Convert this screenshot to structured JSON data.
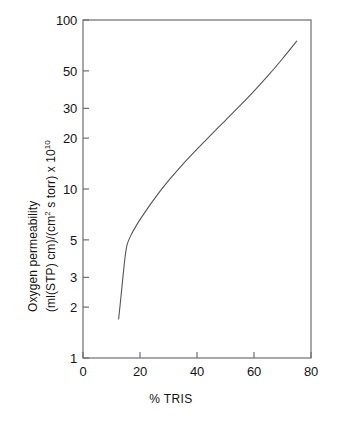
{
  "chart_data": {
    "type": "line",
    "title": "",
    "xlabel": "% TRIS",
    "ylabel_line1": "Oxygen permeability",
    "ylabel_line2_main": "(ml(STP) cm)/(cm",
    "ylabel_line2_sup1": "2",
    "ylabel_line2_mid": " s torr) x 10",
    "ylabel_line2_sup2": "10",
    "yscale": "log",
    "xscale": "linear",
    "xlim": [
      0,
      80
    ],
    "ylim": [
      1,
      100
    ],
    "grid": false,
    "legend": "none",
    "xticks": [
      0,
      20,
      40,
      60,
      80
    ],
    "xtick_labels": [
      "0",
      "20",
      "40",
      "60",
      "80"
    ],
    "yticks": [
      1,
      2,
      3,
      5,
      10,
      20,
      30,
      50,
      100
    ],
    "ytick_labels": [
      "1",
      "2",
      "3",
      "5",
      "10",
      "20",
      "30",
      "50",
      "100"
    ],
    "series": [
      {
        "name": "Oxygen permeability vs % TRIS",
        "color": "#555555",
        "x": [
          12.5,
          13.2,
          14.0,
          14.8,
          15.5,
          17.0,
          19.0,
          22.0,
          26.0,
          30.0,
          35.0,
          40.0,
          45.0,
          50.0,
          55.0,
          60.0,
          65.0,
          70.0,
          75.0
        ],
        "y": [
          1.7,
          2.2,
          3.0,
          4.0,
          4.7,
          5.4,
          6.2,
          7.4,
          9.2,
          11.2,
          14.0,
          17.2,
          21.0,
          25.5,
          31.0,
          38.0,
          47.0,
          59.0,
          75.0
        ]
      }
    ]
  },
  "frame": {
    "left_px": 83,
    "right_px": 311,
    "top_px": 20,
    "bottom_px": 358,
    "axis_color": "#6e6e6e",
    "line_color": "#555555"
  }
}
